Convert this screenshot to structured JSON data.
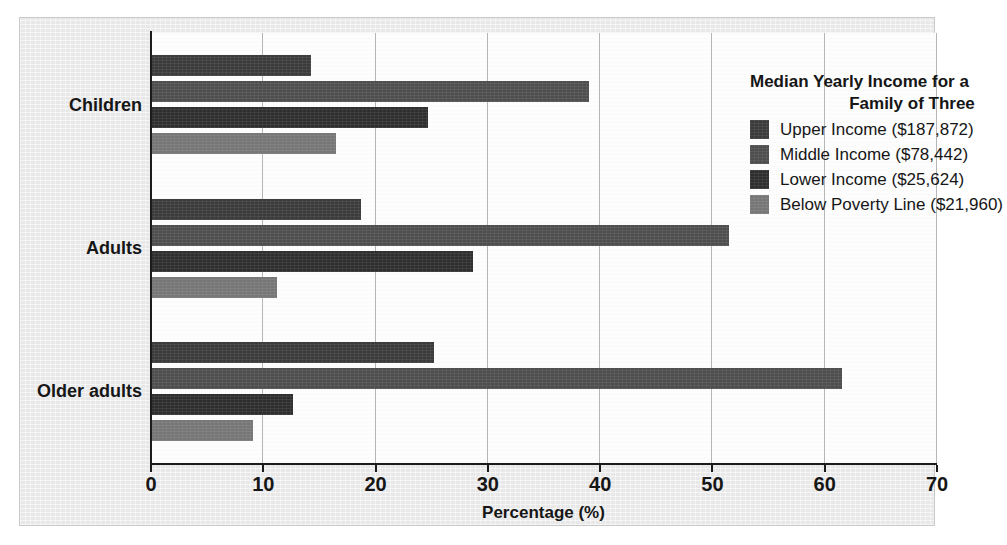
{
  "chart_data": {
    "type": "bar",
    "orientation": "horizontal",
    "title": "",
    "xlabel": "Percentage (%)",
    "ylabel": "",
    "xlim": [
      0,
      70
    ],
    "xticks": [
      0,
      10,
      20,
      30,
      40,
      50,
      60,
      70
    ],
    "grid": true,
    "grid_axis": "x",
    "legend_position": "upper right",
    "legend_title": [
      "Median Yearly Income for a",
      "Family of Three"
    ],
    "categories": [
      "Children",
      "Adults",
      "Older adults"
    ],
    "series": [
      {
        "name": "Upper Income ($187,872)",
        "color": "#3b3b3b",
        "values": [
          14.3,
          18.8,
          25.3
        ]
      },
      {
        "name": "Middle Income ($78,442)",
        "color": "#4e4e4e",
        "values": [
          39.1,
          51.6,
          61.6
        ]
      },
      {
        "name": "Lower Income ($25,624)",
        "color": "#2e2e2e",
        "values": [
          24.8,
          28.8,
          12.7
        ]
      },
      {
        "name": "Below Poverty Line ($21,960)",
        "color": "#767676",
        "values": [
          16.6,
          11.3,
          9.2
        ]
      }
    ]
  }
}
